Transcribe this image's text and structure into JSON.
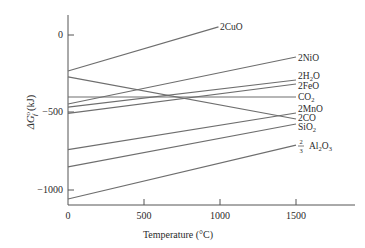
{
  "chart_data": {
    "type": "line",
    "title": "",
    "xlabel": "Temperature (°C)",
    "ylabel": "ΔG°f (kJ)",
    "xlim": [
      0,
      1850
    ],
    "ylim": [
      -1100,
      120
    ],
    "x_ticks": [
      0,
      500,
      1000,
      1500
    ],
    "x_tick_labels": [
      "0",
      "500",
      "1000",
      "1500"
    ],
    "y_ticks": [
      0,
      -500,
      -1000
    ],
    "y_tick_labels": [
      "0",
      "−500",
      "−1000"
    ],
    "grid": false,
    "legend_position": "inline-right-labels",
    "line_color": "#6e6e6e",
    "series": [
      {
        "name": "2CuO",
        "x": [
          0,
          990
        ],
        "y": [
          -232,
          52
        ]
      },
      {
        "name": "2NiO",
        "x": [
          0,
          1500
        ],
        "y": [
          -445,
          -142
        ]
      },
      {
        "name": "2H2O",
        "x": [
          0,
          1500
        ],
        "y": [
          -465,
          -290
        ]
      },
      {
        "name": "2FeO",
        "x": [
          0,
          1500
        ],
        "y": [
          -505,
          -316
        ]
      },
      {
        "name": "CO2",
        "x": [
          0,
          1500
        ],
        "y": [
          -400,
          -400
        ]
      },
      {
        "name": "2MnO",
        "x": [
          0,
          1500
        ],
        "y": [
          -740,
          -503
        ]
      },
      {
        "name": "2CO",
        "x": [
          0,
          1500
        ],
        "y": [
          -270,
          -542
        ]
      },
      {
        "name": "SiO2",
        "x": [
          0,
          1500
        ],
        "y": [
          -850,
          -574
        ]
      },
      {
        "name": "2/3 Al2O3",
        "x": [
          0,
          1500
        ],
        "y": [
          -1058,
          -710
        ]
      }
    ]
  },
  "labels": {
    "cuo": {
      "pre": "2CuO"
    },
    "nio": {
      "pre": "2NiO"
    },
    "h2o": {
      "pre": "2H",
      "sub": "2",
      "post": "O"
    },
    "feo": {
      "pre": "2FeO"
    },
    "co2": {
      "pre": "CO",
      "sub": "2"
    },
    "mno": {
      "pre": "2MnO"
    },
    "co": {
      "pre": "2CO"
    },
    "sio2": {
      "pre": "SiO",
      "sub": "2"
    },
    "al2o3": {
      "frac_num": "2",
      "frac_den": "3",
      "pre": "Al",
      "sub1": "2",
      "mid": "O",
      "sub2": "3"
    }
  },
  "axis": {
    "xlabel": "Temperature (°C)",
    "ylabel_delta": "ΔG",
    "ylabel_sup": "o",
    "ylabel_sub": "f",
    "ylabel_unit": "(kJ)"
  }
}
